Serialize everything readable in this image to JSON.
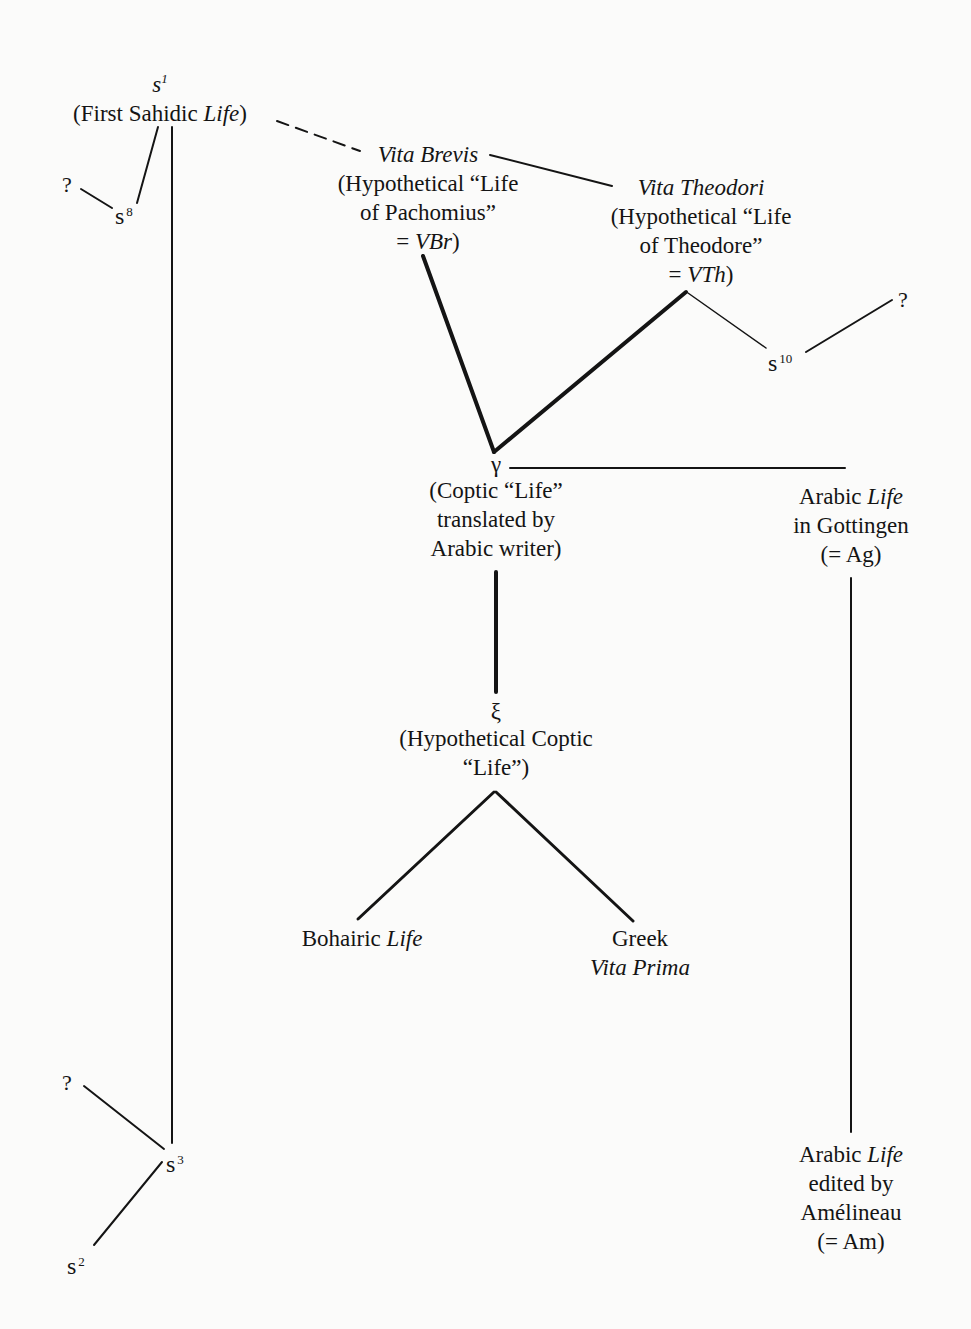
{
  "diagram": {
    "type": "stemma",
    "nodes": {
      "s1": {
        "siglum": "s",
        "sup": "1",
        "label_parts": [
          "(First Sahidic ",
          "Life",
          ")"
        ]
      },
      "s8": {
        "siglum": "s",
        "sup": "8"
      },
      "q_s8": {
        "text": "?"
      },
      "vita_brevis": {
        "title": "Vita Brevis",
        "lines": [
          "(Hypothetical “Life",
          "of Pachomius”"
        ],
        "eq": "= ",
        "abbr": "VBr",
        "close": ")"
      },
      "vita_theodori": {
        "title": "Vita Theodori",
        "lines": [
          "(Hypothetical “Life",
          "of Theodore”"
        ],
        "eq": "= ",
        "abbr": "VTh",
        "close": ")"
      },
      "s10": {
        "siglum": "s",
        "sup": "10"
      },
      "q_s10": {
        "text": "?"
      },
      "gamma": {
        "symbol": "γ",
        "lines": [
          "(Coptic “Life”",
          "translated by",
          "Arabic writer)"
        ]
      },
      "ag": {
        "line1_a": "Arabic ",
        "line1_b": "Life",
        "lines": [
          "in Gottingen",
          "(= Ag)"
        ]
      },
      "xi": {
        "symbol": "ξ",
        "lines": [
          "(Hypothetical Coptic",
          "“Life”)"
        ]
      },
      "bohairic": {
        "a": "Bohairic ",
        "b": "Life"
      },
      "greek": {
        "line1": "Greek",
        "line2": "Vita Prima"
      },
      "am": {
        "line1_a": "Arabic ",
        "line1_b": "Life",
        "lines": [
          "edited by",
          "Amélineau",
          "(= Am)"
        ]
      },
      "s3": {
        "siglum": "s",
        "sup": "3"
      },
      "s2": {
        "siglum": "s",
        "sup": "2"
      },
      "q_s3": {
        "text": "?"
      }
    },
    "edges": [
      {
        "from": "s1",
        "to": "s8",
        "style": "thin"
      },
      {
        "from": "q_s8",
        "to": "s8",
        "style": "thin"
      },
      {
        "from": "s1",
        "to": "s3",
        "style": "thin"
      },
      {
        "from": "s1",
        "to": "vita_brevis",
        "style": "dashed"
      },
      {
        "from": "vita_brevis",
        "to": "vita_theodori",
        "style": "thin"
      },
      {
        "from": "vita_brevis",
        "to": "gamma",
        "style": "thick"
      },
      {
        "from": "vita_theodori",
        "to": "gamma",
        "style": "thick"
      },
      {
        "from": "vita_theodori",
        "to": "s10",
        "style": "thin"
      },
      {
        "from": "s10",
        "to": "q_s10",
        "style": "thin"
      },
      {
        "from": "gamma",
        "to": "ag",
        "style": "thin"
      },
      {
        "from": "gamma",
        "to": "xi",
        "style": "thick"
      },
      {
        "from": "xi",
        "to": "bohairic",
        "style": "thick"
      },
      {
        "from": "xi",
        "to": "greek",
        "style": "thick"
      },
      {
        "from": "ag",
        "to": "am",
        "style": "thin"
      },
      {
        "from": "q_s3",
        "to": "s3",
        "style": "thin"
      },
      {
        "from": "s3",
        "to": "s2",
        "style": "thin"
      }
    ]
  }
}
